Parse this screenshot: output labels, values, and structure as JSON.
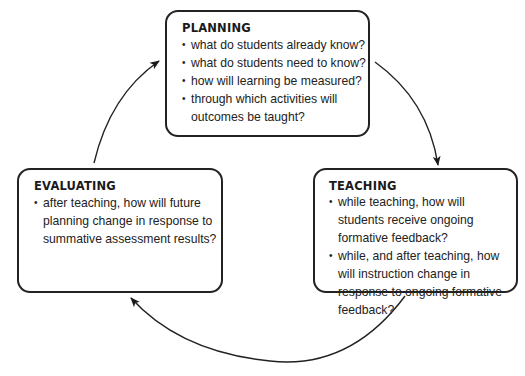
{
  "diagram": {
    "type": "cycle",
    "colors": {
      "stroke": "#222222",
      "background": "#ffffff",
      "text": "#1a1a1a"
    },
    "nodes": [
      {
        "id": "planning",
        "title": "PLANNING",
        "bullets": [
          "what do students already know?",
          "what do students need to know?",
          "how will learning be measured?",
          "through which activities will outcomes be taught?"
        ]
      },
      {
        "id": "teaching",
        "title": "TEACHING",
        "bullets": [
          "while teaching, how will students receive ongoing formative feedback?",
          "while, and after teaching, how will instruction change in response to ongoing formative feedback?"
        ]
      },
      {
        "id": "evaluating",
        "title": "EVALUATING",
        "bullets": [
          "after teaching, how will future planning change in response to summative assessment results?"
        ]
      }
    ],
    "edges": [
      {
        "from": "planning",
        "to": "teaching"
      },
      {
        "from": "teaching",
        "to": "evaluating"
      },
      {
        "from": "evaluating",
        "to": "planning"
      }
    ]
  }
}
